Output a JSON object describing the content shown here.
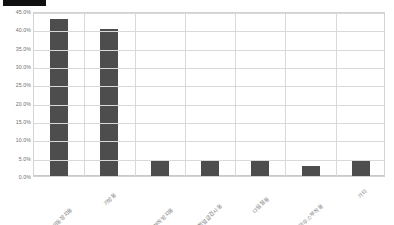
{
  "chart_data": {
    "type": "bar",
    "title": "",
    "xlabel": "",
    "ylabel": "",
    "categories": [
      "커서이동장치용",
      "가방용",
      "잉크부착방지용",
      "정밀급검사용",
      "다림질용",
      "마우스부착용",
      "기타"
    ],
    "values": [
      42.8,
      40.0,
      4.0,
      4.0,
      4.0,
      2.7,
      4.0
    ],
    "value_labels": [
      "42.8%",
      "40.0%",
      "4.0%",
      "4.0%",
      "4.0%",
      "2.7%",
      "4.0%"
    ],
    "ylim": [
      0.0,
      45.0
    ],
    "ytick_labels": [
      "0.0%",
      "5.0%",
      "10.0%",
      "15.0%",
      "20.0%",
      "25.0%",
      "30.0%",
      "35.0%",
      "40.0%",
      "45.0%"
    ],
    "ytick_values": [
      0,
      5,
      10,
      15,
      20,
      25,
      30,
      35,
      40,
      45
    ],
    "grid": "horizontal-and-vertical",
    "legend": "none",
    "bar_color": "#4d4d4d",
    "grid_color": "#d9d9d9",
    "axis_text_color": "#6e6e6e",
    "background_color": "#ffffff"
  },
  "annotations": {
    "redaction_label": "redacted-title-bar",
    "redaction_color": "#111111"
  }
}
